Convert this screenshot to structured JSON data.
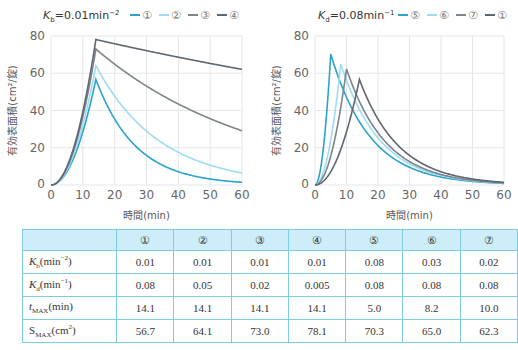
{
  "chart_data": [
    {
      "type": "line",
      "title": "K_b = 0.01 min^-2",
      "title_parts": {
        "sym": "K",
        "sub": "b",
        "rest": "=0.01min",
        "sup": "−2"
      },
      "xlabel": "時間(min)",
      "ylabel": "有効表面積(cm²/錠)",
      "xlim": [
        0,
        60
      ],
      "ylim": [
        0,
        80
      ],
      "xticks": [
        0,
        10,
        20,
        30,
        40,
        50,
        60
      ],
      "yticks": [
        0,
        20,
        40,
        60,
        80
      ],
      "grid": true,
      "legend_position": "top",
      "series": [
        {
          "name": "①",
          "color": "#2aa3cf",
          "Kb": 0.01,
          "Kd": 0.08,
          "tmax": 14.1,
          "smax": 56.7
        },
        {
          "name": "②",
          "color": "#9fdcef",
          "Kb": 0.01,
          "Kd": 0.05,
          "tmax": 14.1,
          "smax": 64.1
        },
        {
          "name": "③",
          "color": "#7d848c",
          "Kb": 0.01,
          "Kd": 0.02,
          "tmax": 14.1,
          "smax": 73.0
        },
        {
          "name": "④",
          "color": "#5e6670",
          "Kb": 0.01,
          "Kd": 0.005,
          "tmax": 14.1,
          "smax": 78.1
        }
      ]
    },
    {
      "type": "line",
      "title": "K_d = 0.08 min^-1",
      "title_parts": {
        "sym": "K",
        "sub": "d",
        "rest": "=0.08min",
        "sup": "−1"
      },
      "xlabel": "時間(min)",
      "ylabel": "有効表面積(cm²/錠)",
      "xlim": [
        0,
        60
      ],
      "ylim": [
        0,
        80
      ],
      "xticks": [
        0,
        10,
        20,
        30,
        40,
        50,
        60
      ],
      "yticks": [
        0,
        20,
        40,
        60,
        80
      ],
      "grid": true,
      "legend_position": "top",
      "series": [
        {
          "name": "⑤",
          "color": "#2aa3cf",
          "Kb": 0.08,
          "Kd": 0.08,
          "tmax": 5.0,
          "smax": 70.3
        },
        {
          "name": "⑥",
          "color": "#9fdcef",
          "Kb": 0.03,
          "Kd": 0.08,
          "tmax": 8.2,
          "smax": 65.0
        },
        {
          "name": "⑦",
          "color": "#7d848c",
          "Kb": 0.02,
          "Kd": 0.08,
          "tmax": 10.0,
          "smax": 62.3
        },
        {
          "name": "①",
          "color": "#5e6670",
          "Kb": 0.01,
          "Kd": 0.08,
          "tmax": 14.1,
          "smax": 56.7
        }
      ]
    }
  ],
  "table": {
    "header": [
      "",
      "①",
      "②",
      "③",
      "④",
      "⑤",
      "⑥",
      "⑦"
    ],
    "rows": [
      {
        "label_sym": "K",
        "label_sub": "b",
        "label_rest": "(min",
        "label_sup": "−2",
        "label_end": ")",
        "values": [
          "0.01",
          "0.01",
          "0.01",
          "0.01",
          "0.08",
          "0.03",
          "0.02"
        ]
      },
      {
        "label_sym": "K",
        "label_sub": "d",
        "label_rest": "(min",
        "label_sup": "−1",
        "label_end": ")",
        "values": [
          "0.08",
          "0.05",
          "0.02",
          "0.005",
          "0.08",
          "0.08",
          "0.08"
        ]
      },
      {
        "label_sym": "t",
        "label_sub": "MAX",
        "label_rest": "(min)",
        "label_sup": "",
        "label_end": "",
        "values": [
          "14.1",
          "14.1",
          "14.1",
          "14.1",
          "5.0",
          "8.2",
          "10.0"
        ]
      },
      {
        "label_sym": "S",
        "label_sub": "MAX",
        "label_rest": "(cm",
        "label_sup": "2",
        "label_end": ")",
        "values": [
          "56.7",
          "64.1",
          "73.0",
          "78.1",
          "70.3",
          "65.0",
          "62.3"
        ]
      }
    ]
  }
}
